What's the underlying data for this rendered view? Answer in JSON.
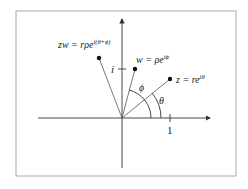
{
  "diagram": {
    "frame_color": "#b8b8b8",
    "line_color": "#333333",
    "axes": {
      "real_tick_label": "1",
      "imag_tick_label": "i"
    },
    "points": [
      {
        "id": "z",
        "label": "z = re",
        "exponent": "iθ"
      },
      {
        "id": "w",
        "label": "w = ρe",
        "exponent": "iϕ"
      },
      {
        "id": "zw",
        "label": "zw = rρe",
        "exponent": "i(θ+ϕ)"
      }
    ],
    "angles": {
      "theta": "θ",
      "phi": "ϕ"
    }
  }
}
